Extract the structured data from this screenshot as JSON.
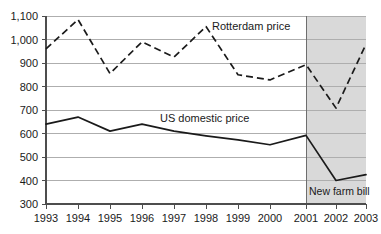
{
  "chart_data": {
    "type": "line",
    "title": "",
    "subtitle": "",
    "xlabel": "",
    "ylabel": "",
    "categories": [
      "1993",
      "1994",
      "1995",
      "1996",
      "1997",
      "1998",
      "1999",
      "2000",
      "2001",
      "2002",
      "2003"
    ],
    "x": [
      1993,
      1994,
      1995,
      1996,
      1997,
      1998,
      1999,
      2000,
      2001,
      2002,
      2003
    ],
    "series": [
      {
        "name": "Rotterdam price",
        "style": "dashed",
        "values": [
          960,
          1085,
          855,
          990,
          925,
          1055,
          850,
          828,
          893,
          708,
          980
        ]
      },
      {
        "name": "US domestic price",
        "style": "solid",
        "values": [
          640,
          670,
          610,
          640,
          610,
          590,
          573,
          552,
          592,
          400,
          425
        ]
      }
    ],
    "ylim": [
      300,
      1100
    ],
    "yticks": [
      300,
      400,
      500,
      600,
      700,
      800,
      900,
      1000,
      1100
    ],
    "ytick_labels": [
      "300",
      "400",
      "500",
      "600",
      "700",
      "800",
      "900",
      "1,000",
      "1,100"
    ],
    "xticks": [
      1993,
      1994,
      1995,
      1996,
      1997,
      1998,
      1999,
      2000,
      2001,
      2002,
      2003
    ],
    "xtick_labels": [
      "1993",
      "1994",
      "1995",
      "1996",
      "1997",
      "1998",
      "1999",
      "2000",
      "2001",
      "2002",
      "2003"
    ],
    "grid": "horizontal",
    "legend": "inline-annotations",
    "annotations": [
      {
        "id": "rotterdam-label",
        "text": "Rotterdam price",
        "x_value": 1998.25,
        "y_value": 1045
      },
      {
        "id": "us-domestic-label",
        "text": "US domestic price",
        "x_value": 1996.45,
        "y_value": 672
      },
      {
        "id": "new-farm-bill-label",
        "text": "New farm bill",
        "x_value": 2001.1,
        "y_value": 350
      }
    ],
    "shaded_regions": [
      {
        "id": "new-farm-bill-region",
        "label": "New farm bill",
        "x_start": 2001,
        "x_end": 2003,
        "color": "#d9d9d9"
      }
    ],
    "colors": {
      "line": "#1a1a1a",
      "gridline": "#aeaeae",
      "axis": "#4d4d4d",
      "shading": "#d9d9d9",
      "background": "#ffffff"
    }
  }
}
